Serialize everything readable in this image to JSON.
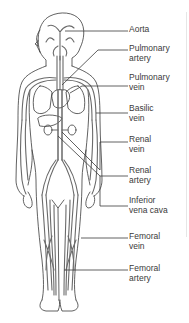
{
  "diagram": {
    "figure_alt": "Front-view outline of a human body showing major arteries and veins",
    "colors": {
      "outline": "#3a3a3a",
      "vessel": "#6a6a6a",
      "leader": "#3a3a3a",
      "text": "#3a3a3a",
      "background": "#ffffff"
    },
    "labels": [
      {
        "id": "aorta",
        "text": "Aorta",
        "top": 25
      },
      {
        "id": "pulmonary-artery",
        "text": "Pulmonary\nartery",
        "top": 44
      },
      {
        "id": "pulmonary-vein",
        "text": "Pulmonary\nvein",
        "top": 73
      },
      {
        "id": "basilic-vein",
        "text": "Basilic\nvein",
        "top": 104
      },
      {
        "id": "renal-vein",
        "text": "Renal\nvein",
        "top": 135
      },
      {
        "id": "renal-artery",
        "text": "Renal\nartery",
        "top": 166
      },
      {
        "id": "inferior-vena-cava",
        "text": "Inferior\nvena cava",
        "top": 196
      },
      {
        "id": "femoral-vein",
        "text": "Femoral\nvein",
        "top": 232
      },
      {
        "id": "femoral-artery",
        "text": "Femoral\nartery",
        "top": 264
      }
    ]
  }
}
